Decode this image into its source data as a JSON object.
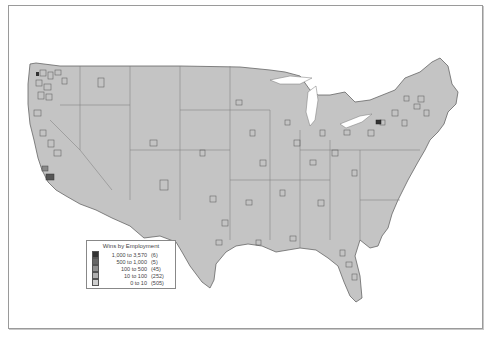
{
  "map": {
    "subject": "Contiguous United States counties",
    "fill_color": "#c4c4c4",
    "border_color": "#555555",
    "background": "#ffffff"
  },
  "legend": {
    "title": "Wins by Employment",
    "items": [
      {
        "range": "1,000 to 3,570",
        "count": "(6)",
        "color": "#333333"
      },
      {
        "range": "500 to 1,000",
        "count": "(5)",
        "color": "#666666"
      },
      {
        "range": "100 to 500",
        "count": "(45)",
        "color": "#8f8f8f"
      },
      {
        "range": "10 to 100",
        "count": "(252)",
        "color": "#b0b0b0"
      },
      {
        "range": "0 to 10",
        "count": "(505)",
        "color": "#cfcfcf"
      }
    ]
  }
}
